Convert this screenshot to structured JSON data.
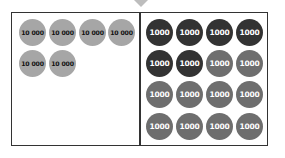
{
  "diagram": {
    "pointer": "down-triangle",
    "left_panel": {
      "coins": [
        {
          "label": "10 000",
          "color": "#a6a6a6"
        },
        {
          "label": "10 000",
          "color": "#a6a6a6"
        },
        {
          "label": "10 000",
          "color": "#a6a6a6"
        },
        {
          "label": "10 000",
          "color": "#a6a6a6"
        },
        {
          "label": "10 000",
          "color": "#a6a6a6"
        },
        {
          "label": "10 000",
          "color": "#a6a6a6"
        }
      ]
    },
    "right_panel": {
      "coins": [
        {
          "label": "1000",
          "color": "#333333"
        },
        {
          "label": "1000",
          "color": "#333333"
        },
        {
          "label": "1000",
          "color": "#333333"
        },
        {
          "label": "1000",
          "color": "#333333"
        },
        {
          "label": "1000",
          "color": "#333333"
        },
        {
          "label": "1000",
          "color": "#333333"
        },
        {
          "label": "1000",
          "color": "#6e6e6e"
        },
        {
          "label": "1000",
          "color": "#6e6e6e"
        },
        {
          "label": "1000",
          "color": "#6e6e6e"
        },
        {
          "label": "1000",
          "color": "#6e6e6e"
        },
        {
          "label": "1000",
          "color": "#6e6e6e"
        },
        {
          "label": "1000",
          "color": "#6e6e6e"
        },
        {
          "label": "1000",
          "color": "#6e6e6e"
        },
        {
          "label": "1000",
          "color": "#6e6e6e"
        },
        {
          "label": "1000",
          "color": "#6e6e6e"
        },
        {
          "label": "1000",
          "color": "#6e6e6e"
        }
      ]
    }
  }
}
